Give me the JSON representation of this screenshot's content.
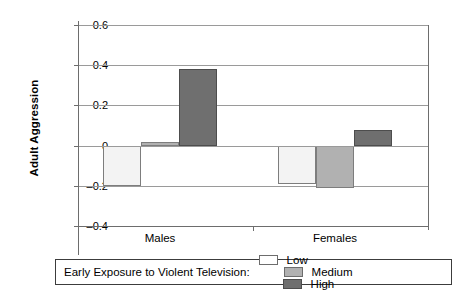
{
  "chart_data": {
    "type": "bar",
    "title": "",
    "xlabel": "",
    "ylabel": "Adult Aggression",
    "categories": [
      "Males",
      "Females"
    ],
    "ylim": [
      -0.4,
      0.6
    ],
    "ytick_labels": [
      "0.6",
      "0.4",
      "0.2",
      "0",
      "–0.2",
      "–0.4"
    ],
    "ytick_values": [
      0.6,
      0.4,
      0.2,
      0,
      -0.2,
      -0.4
    ],
    "grid": true,
    "legend_position": "bottom",
    "legend_title": "Early Exposure to Violent Television:",
    "series": [
      {
        "name": "Low",
        "color": "#f3f3f3",
        "values": [
          -0.2,
          -0.19
        ]
      },
      {
        "name": "Medium",
        "color": "#b1b1b1",
        "values": [
          0.02,
          -0.21
        ]
      },
      {
        "name": "High",
        "color": "#6f6f6f",
        "values": [
          0.38,
          0.08
        ]
      }
    ]
  },
  "axes": {
    "y_title": "Adult Aggression",
    "ticks": [
      {
        "label": "0.6",
        "value": 0.6
      },
      {
        "label": "0.4",
        "value": 0.4
      },
      {
        "label": "0.2",
        "value": 0.2
      },
      {
        "label": "0",
        "value": 0
      },
      {
        "label": "–0.2",
        "value": -0.2
      },
      {
        "label": "–0.4",
        "value": -0.4
      }
    ],
    "category_labels": [
      "Males",
      "Females"
    ]
  },
  "legend": {
    "title": "Early Exposure to Violent Television:",
    "items": [
      {
        "label": "Low",
        "swatch": "low"
      },
      {
        "label": "Medium",
        "swatch": "medium"
      },
      {
        "label": "High",
        "swatch": "high"
      }
    ]
  },
  "colors": {
    "low": "#f3f3f3",
    "medium": "#b1b1b1",
    "high": "#6f6f6f",
    "gridline": "#9a9a9a",
    "axis": "#6d6d6d",
    "legend_border": "#3c3c3c",
    "text": "#000000"
  }
}
